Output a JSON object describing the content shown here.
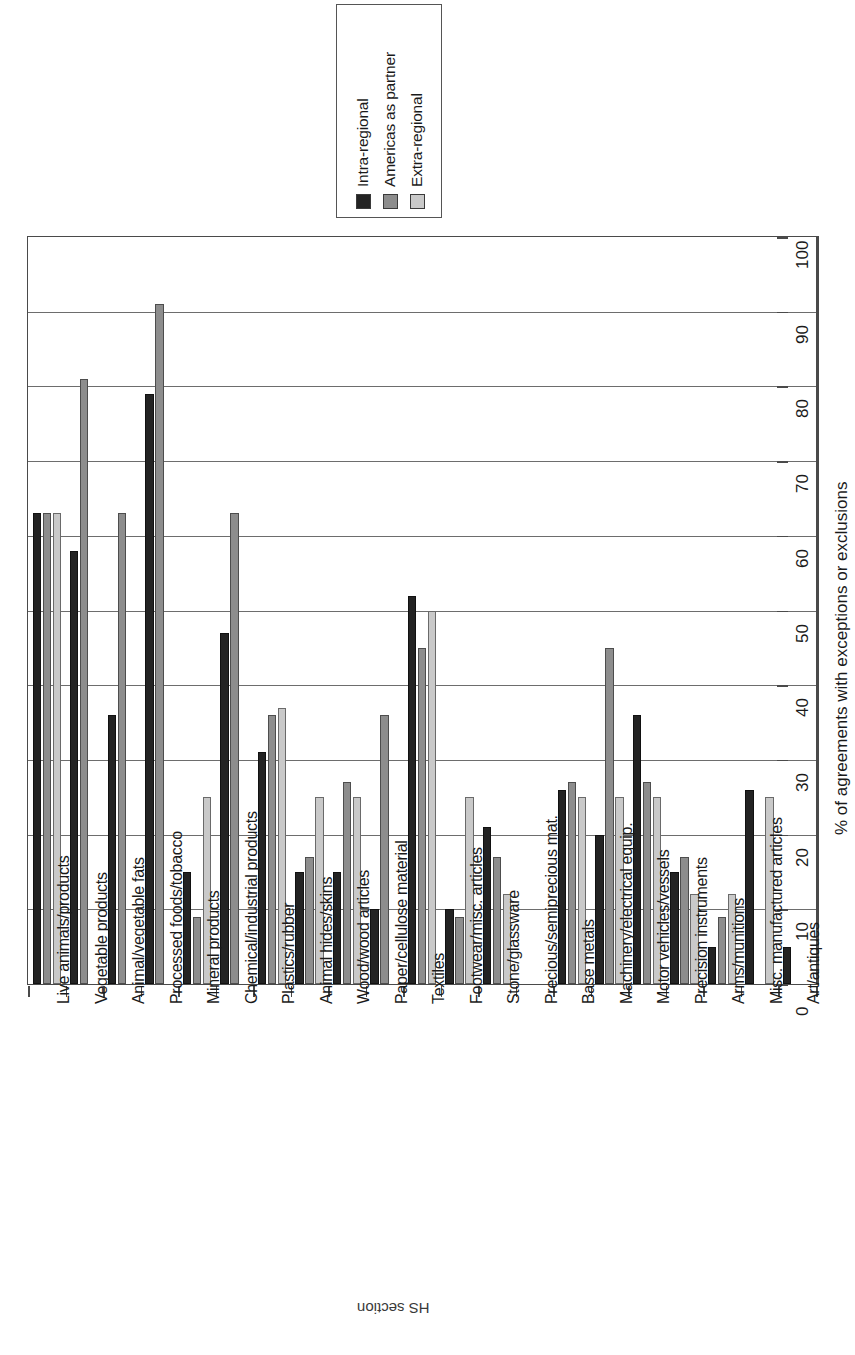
{
  "chart_data": {
    "type": "bar",
    "title": "",
    "orientation": "horizontal-rotated",
    "xlabel": "HS section",
    "ylabel": "% of agreements with exceptions or exclusions",
    "ylim": [
      0,
      100
    ],
    "yticks": [
      0,
      10,
      20,
      30,
      40,
      50,
      60,
      70,
      80,
      90,
      100
    ],
    "grid": true,
    "legend_position": "top",
    "legend_border": true,
    "categories": [
      "Live animals/products",
      "Vegetable products",
      "Animal/vegetable fats",
      "Processed foods/tobacco",
      "Mineral products",
      "Chemical/industrial products",
      "Plastics/rubber",
      "Animal hides/skins",
      "Wood/wood articles",
      "Paper/cellulose material",
      "Textiles",
      "Footwear/misc. articles",
      "Stone/glassware",
      "Precious/semiprecious mat.",
      "Base metals",
      "Machinery/electrical equip.",
      "Motor vehicles/vessels",
      "Precision instruments",
      "Arms/munitions",
      "Misc. manufactured articles",
      "Art/antiques"
    ],
    "series": [
      {
        "name": "Intra-regional",
        "color": "#232323",
        "values": [
          63,
          58,
          36,
          79,
          15,
          47,
          31,
          15,
          15,
          10,
          52,
          10,
          21,
          0,
          26,
          20,
          36,
          15,
          5,
          26,
          5
        ]
      },
      {
        "name": "Americas as partner",
        "color": "#8d8d8d",
        "values": [
          63,
          81,
          63,
          91,
          9,
          63,
          36,
          17,
          27,
          36,
          45,
          9,
          17,
          0,
          27,
          45,
          27,
          17,
          9,
          0,
          0
        ]
      },
      {
        "name": "Extra-regional",
        "color": "#c9c9c9",
        "values": [
          63,
          0,
          0,
          0,
          25,
          0,
          37,
          25,
          25,
          0,
          50,
          25,
          12,
          0,
          25,
          25,
          25,
          12,
          12,
          25,
          0
        ]
      }
    ]
  },
  "legend": {
    "items": [
      {
        "label": "Intra-regional",
        "color": "#232323"
      },
      {
        "label": "Americas as partner",
        "color": "#8d8d8d"
      },
      {
        "label": "Extra-regional",
        "color": "#c9c9c9"
      }
    ]
  },
  "axes": {
    "value_axis_title": "% of agreements with exceptions or exclusions",
    "category_axis_title": "HS section",
    "tick_labels": [
      "0",
      "10",
      "20",
      "30",
      "40",
      "50",
      "60",
      "70",
      "80",
      "90",
      "100"
    ]
  }
}
